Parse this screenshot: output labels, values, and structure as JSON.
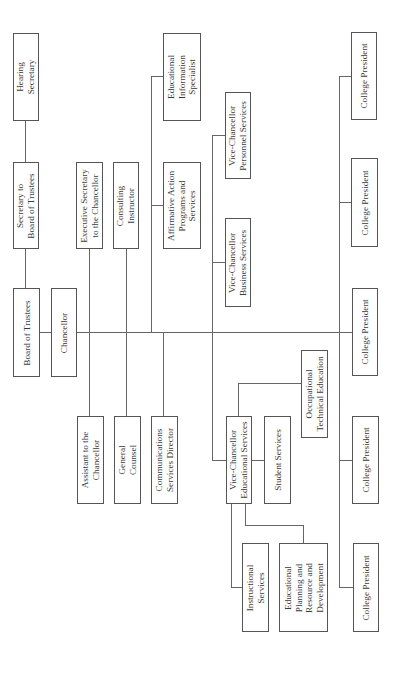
{
  "diagram": {
    "type": "org-chart",
    "orientation": "rotated-90-ccw",
    "line_color": "#666666",
    "border_color": "#555555",
    "text_color": "#3a3a3a",
    "nodes": {
      "hearing_secretary": "Hearing\nSecretary",
      "secretary_board": "Secretary to\nBoard of Trustees",
      "board_of_trustees": "Board of Trustees",
      "chancellor": "Chancellor",
      "exec_secretary": "Executive Secretary\nto the Chancellor",
      "consulting_instructor": "Consulting\nInstructor",
      "affirmative_action": "Affirmative Action\nPrograms and\nServices",
      "edu_info_specialist": "Educational\nInformation\nSpecialist",
      "vc_personnel": "Vice-Chancellor\nPersonnel Services",
      "vc_business": "Vice-Chancellor\nBusiness Services",
      "college_president_1": "College President",
      "college_president_2": "College President",
      "college_president_3": "College President",
      "college_president_4": "College President",
      "college_president_5": "College President",
      "occupational_tech": "Occupational\nTechnical Education",
      "assistant_chancellor": "Assistant to the\nChancellor",
      "general_counsel": "General\nCounsel",
      "communications_director": "Communications\nServices Director",
      "vc_educational": "Vice-Chancellor\nEducational Services",
      "student_services": "Student Services",
      "instructional_services": "Instructional\nServices",
      "edu_planning": "Educational\nPlanning and\nResource and\nDevelopment"
    },
    "hierarchy": [
      {
        "name": "Board of Trustees",
        "children": [
          "Secretary to Board of Trustees",
          "Chancellor"
        ]
      },
      {
        "name": "Secretary to Board of Trustees",
        "children": [
          "Hearing Secretary"
        ]
      },
      {
        "name": "Chancellor",
        "children": [
          "Executive Secretary to the Chancellor",
          "Consulting Instructor",
          "Affirmative Action Programs and Services",
          "Assistant to the Chancellor",
          "General Counsel",
          "Communications Services Director",
          "Vice-Chancellor Personnel Services",
          "Vice-Chancellor Business Services",
          "Vice-Chancellor Educational Services",
          "College President",
          "College President",
          "College President",
          "College President",
          "College President"
        ]
      },
      {
        "name": "Affirmative Action Programs and Services",
        "children": [
          "Educational Information Specialist"
        ]
      },
      {
        "name": "Vice-Chancellor Educational Services",
        "children": [
          "Student Services",
          "Occupational Technical Education",
          "Instructional Services",
          "Educational Planning and Resource and Development"
        ]
      }
    ]
  }
}
